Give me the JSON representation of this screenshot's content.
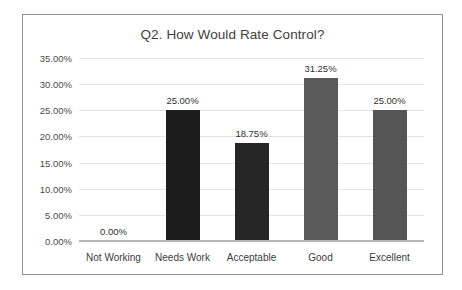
{
  "chart_data": {
    "type": "bar",
    "title": "Q2. How Would Rate Control?",
    "xlabel": "",
    "ylabel": "",
    "categories": [
      "Not Working",
      "Needs Work",
      "Acceptable",
      "Good",
      "Excellent"
    ],
    "values": [
      0.0,
      25.0,
      18.75,
      31.25,
      25.0
    ],
    "value_labels": [
      "0.00%",
      "25.00%",
      "18.75%",
      "31.25%",
      "25.00%"
    ],
    "bar_colors": [
      "#1c1c1c",
      "#1c1c1c",
      "#262626",
      "#5a5a5a",
      "#555555"
    ],
    "ylim": [
      0,
      35
    ],
    "ytick_values": [
      0,
      5,
      10,
      15,
      20,
      25,
      30,
      35
    ],
    "ytick_labels": [
      "0.00%",
      "5.00%",
      "10.00%",
      "15.00%",
      "20.00%",
      "25.00%",
      "30.00%",
      "35.00%"
    ],
    "grid": true,
    "legend": false,
    "legend_position": "none",
    "units": "percent"
  },
  "colors": {
    "frame_border": "#8f8f8f",
    "gridline": "#e3e3e3",
    "axis_line": "#b7b7b7",
    "title_text": "#404040",
    "tick_text": "#4a4a4a",
    "label_text": "#303030",
    "category_text": "#3b3b3b",
    "background": "#ffffff"
  }
}
